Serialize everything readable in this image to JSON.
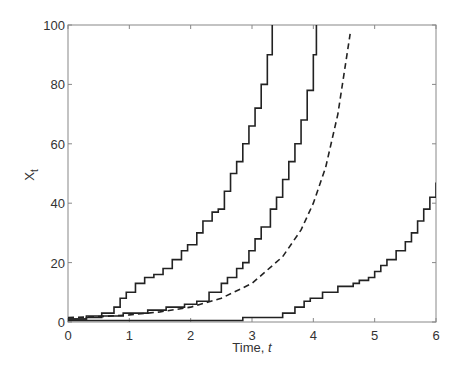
{
  "chart_data": {
    "type": "line",
    "title": "",
    "xlabel": "Time, t",
    "ylabel": "X_t",
    "xlim": [
      0,
      6
    ],
    "ylim": [
      0,
      100
    ],
    "xticks": [
      0,
      1,
      2,
      3,
      4,
      5,
      6
    ],
    "yticks": [
      0,
      20,
      40,
      60,
      80,
      100
    ],
    "grid": false,
    "legend": null,
    "series": [
      {
        "name": "sample path 1",
        "style": "solid-step",
        "x": [
          0,
          0.3,
          0.55,
          0.75,
          0.85,
          0.95,
          1.1,
          1.25,
          1.4,
          1.55,
          1.7,
          1.85,
          1.95,
          2.1,
          2.2,
          2.35,
          2.45,
          2.55,
          2.65,
          2.75,
          2.85,
          2.95,
          3.05,
          3.15,
          3.25,
          3.33
        ],
        "y": [
          1,
          1.5,
          3,
          5,
          8,
          10,
          13,
          15,
          16,
          18,
          21,
          24,
          26,
          30,
          34,
          37,
          38,
          44,
          50,
          54,
          60,
          66,
          72,
          80,
          90,
          100
        ]
      },
      {
        "name": "sample path 2",
        "style": "solid-step",
        "x": [
          0,
          0.3,
          0.9,
          1.3,
          1.6,
          1.9,
          2.1,
          2.3,
          2.5,
          2.6,
          2.75,
          2.85,
          2.95,
          3.05,
          3.15,
          3.3,
          3.4,
          3.5,
          3.6,
          3.7,
          3.8,
          3.9,
          4.0,
          4.05
        ],
        "y": [
          1,
          2,
          3,
          4,
          5,
          6,
          7,
          10,
          13,
          15,
          18,
          20,
          24,
          28,
          32,
          38,
          42,
          48,
          54,
          60,
          68,
          78,
          90,
          100
        ]
      },
      {
        "name": "mean (deterministic)",
        "style": "dashed",
        "x": [
          0,
          0.5,
          1.0,
          1.5,
          2.0,
          2.5,
          3.0,
          3.5,
          3.8,
          4.0,
          4.2,
          4.4,
          4.6
        ],
        "y": [
          1.5,
          1.8,
          2.4,
          3.4,
          5.0,
          8.0,
          13,
          22,
          31,
          40,
          52,
          70,
          97
        ]
      },
      {
        "name": "sample path 3",
        "style": "solid-step",
        "x": [
          0,
          2.85,
          3.5,
          3.7,
          3.85,
          3.95,
          4.15,
          4.4,
          4.65,
          4.75,
          4.9,
          5.0,
          5.1,
          5.2,
          5.35,
          5.5,
          5.6,
          5.7,
          5.8,
          5.9,
          6.0
        ],
        "y": [
          0.5,
          1.5,
          3,
          5,
          7,
          8,
          10,
          12,
          13,
          14,
          15,
          17,
          19,
          21,
          24,
          27,
          30,
          34,
          38,
          42,
          47
        ]
      }
    ]
  }
}
